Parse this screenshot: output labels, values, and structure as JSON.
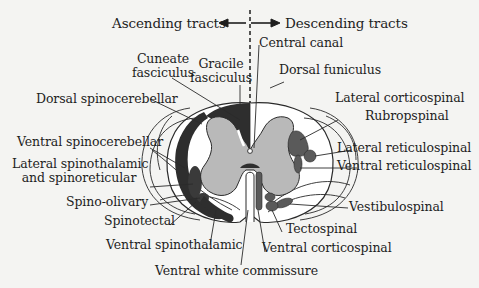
{
  "header": {
    "ascending": "Ascending tracts",
    "descending": "Descending tracts"
  },
  "labels": {
    "central_canal": "Central canal",
    "cuneate_1": "Cuneate",
    "cuneate_2": "fasciculus",
    "gracile_1": "Gracile",
    "gracile_2": "fasciculus",
    "dorsal_funiculus": "Dorsal funiculus",
    "dorsal_spinocerebellar": "Dorsal spinocerebellar",
    "ventral_spinocerebellar": "Ventral spinocerebellar",
    "lateral_spinothalamic_1": "Lateral spinothalamic",
    "lateral_spinothalamic_2": "and spinoreticular",
    "spino_olivary": "Spino-olivary",
    "spinotectal": "Spinotectal",
    "ventral_spinothalamic": "Ventral spinothalamic",
    "ventral_white_commissure": "Ventral white commissure",
    "lateral_corticospinal": "Lateral corticospinal",
    "rubrospinal": "Rubropspinal",
    "lateral_reticulospinal": "Lateral reticulospinal",
    "ventral_reticulospinal": "Ventral reticulospinal",
    "vestibulospinal": "Vestibulospinal",
    "tectospinal": "Tectospinal",
    "ventral_corticospinal": "Ventral corticospinal"
  },
  "colors": {
    "background": "#f4f4f2",
    "white_matter": "#ffffff",
    "gray_matter": "#b9b9b9",
    "ascending_tract": "#2e2e2e",
    "descending_tract": "#5a5a5a",
    "line": "#2a2a2a"
  }
}
